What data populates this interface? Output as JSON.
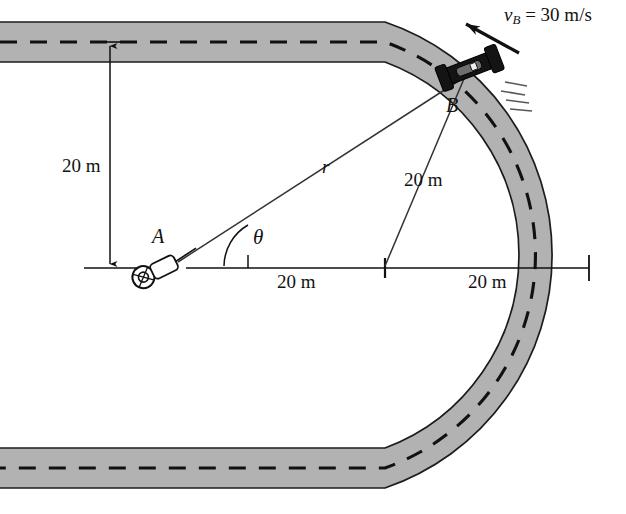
{
  "figure": {
    "canvas": {
      "width": 626,
      "height": 514
    },
    "colors": {
      "track_fill": "#b2b2b2",
      "track_edge": "#1c1c1c",
      "center_line": "#111111",
      "dimension_line": "#111111",
      "car_body": "#141414",
      "background": "#ffffff"
    }
  },
  "labels": {
    "velocity": {
      "symbol": "v",
      "subscript": "B",
      "equals": "=",
      "value": "30",
      "units": "m/s",
      "full": "v_B = 30 m/s"
    },
    "point_a": "A",
    "point_b": "B",
    "radius_symbol": "r",
    "angle_symbol": "θ",
    "dim_vertical": "20 m",
    "dim_horizontal_left": "20 m",
    "dim_horizontal_right": "20 m",
    "dim_radius": "20 m"
  },
  "geometry": {
    "observer_a": {
      "x": 152,
      "y": 268
    },
    "car_b": {
      "x": 470,
      "y": 68
    },
    "curve_center": {
      "x": 385,
      "y": 268
    },
    "track_top_centerline_y": 42,
    "track_bottom_centerline_y": 468,
    "baseline_y": 268,
    "track_half_width": 20,
    "curve_radius_centerline": 226
  },
  "annotations": {
    "vertical_dimension": {
      "from_y": 42,
      "to_y": 268,
      "x": 110,
      "value": "20 m"
    },
    "horizontal_dimension": {
      "from_x": 248,
      "to_x": 589,
      "y": 268,
      "tick_mid_x": 385
    },
    "angle_arc": {
      "vertex_x": 248,
      "vertex_y": 268,
      "degrees": 38
    }
  }
}
